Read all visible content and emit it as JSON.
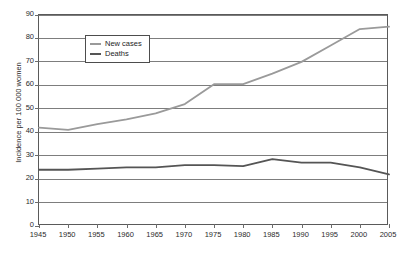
{
  "chart_data": {
    "type": "line",
    "title": "",
    "xlabel": "",
    "ylabel": "Incidence per 100 000 women",
    "x": [
      1945,
      1950,
      1955,
      1960,
      1965,
      1970,
      1975,
      1980,
      1985,
      1990,
      1995,
      2000,
      2005
    ],
    "xticklabels": [
      "1945",
      "1950",
      "1955",
      "1960",
      "1965",
      "1970",
      "1975",
      "1980",
      "1985",
      "1990",
      "1995",
      "2000",
      "2005"
    ],
    "yticklabels": [
      "0",
      "10",
      "20",
      "30",
      "40",
      "50",
      "60",
      "70",
      "80",
      "90"
    ],
    "yticks": [
      0,
      10,
      20,
      30,
      40,
      50,
      60,
      70,
      80,
      90
    ],
    "xlim": [
      1945,
      2005
    ],
    "ylim": [
      0,
      90
    ],
    "grid": "horizontal",
    "legend_position": "top-left",
    "series": [
      {
        "name": "New cases",
        "color": "#9a9a9a",
        "values": [
          42,
          41,
          43.5,
          45.5,
          48,
          52,
          60.5,
          60.5,
          65,
          70,
          77,
          84,
          85
        ]
      },
      {
        "name": "Deaths",
        "color": "#555555",
        "values": [
          24,
          24,
          24.5,
          25,
          25,
          26,
          26,
          25.5,
          28.5,
          27,
          27,
          25,
          22
        ]
      }
    ]
  },
  "legend": {
    "items": [
      {
        "label": "New cases"
      },
      {
        "label": "Deaths"
      }
    ]
  },
  "colors": {
    "new_cases": "#9a9a9a",
    "deaths": "#555555",
    "grid": "#7d7d7d",
    "frame": "#5a5a5a",
    "text": "#2b2b2b",
    "background": "#ffffff"
  }
}
